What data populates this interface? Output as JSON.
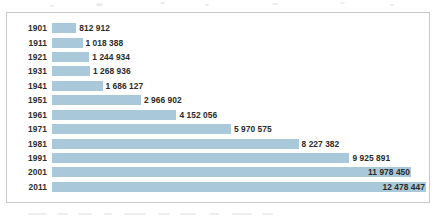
{
  "chart_data": {
    "type": "bar",
    "orientation": "horizontal",
    "title": "",
    "subtitle": "",
    "xlabel": "",
    "ylabel": "",
    "categories": [
      "1901",
      "1911",
      "1921",
      "1931",
      "1941",
      "1951",
      "1961",
      "1971",
      "1981",
      "1991",
      "2001",
      "2011"
    ],
    "values": [
      812912,
      1018388,
      1244934,
      1268936,
      1686127,
      2966902,
      4152056,
      5970575,
      8227382,
      9925891,
      11978450,
      12478447
    ],
    "value_labels": [
      "812 912",
      "1 018 388",
      "1 244 934",
      "1 268 936",
      "1 686 127",
      "2 966 902",
      "4 152 056",
      "5 970 575",
      "8 227 382",
      "9 925 891",
      "11 978 450",
      "12 478 447"
    ],
    "xlim": [
      0,
      12478447
    ],
    "grid": false,
    "legend": null,
    "legend_position": "none",
    "series": [
      {
        "name": "",
        "values": [
          812912,
          1018388,
          1244934,
          1268936,
          1686127,
          2966902,
          4152056,
          5970575,
          8227382,
          9925891,
          11978450,
          12478447
        ]
      }
    ],
    "bar_color": "#a9c8da",
    "label_color": "#2b2b2b",
    "frame_color": "#c9c9c9",
    "background_color": "#ffffff",
    "number_format": "space-separated thousands"
  },
  "rows": [
    {
      "year": "1901",
      "value": 812912,
      "label": "812 912"
    },
    {
      "year": "1911",
      "value": 1018388,
      "label": "1 018 388"
    },
    {
      "year": "1921",
      "value": 1244934,
      "label": "1 244 934"
    },
    {
      "year": "1931",
      "value": 1268936,
      "label": "1 268 936"
    },
    {
      "year": "1941",
      "value": 1686127,
      "label": "1 686 127"
    },
    {
      "year": "1951",
      "value": 2966902,
      "label": "2 966 902"
    },
    {
      "year": "1961",
      "value": 4152056,
      "label": "4 152 056"
    },
    {
      "year": "1971",
      "value": 5970575,
      "label": "5 970 575"
    },
    {
      "year": "1981",
      "value": 8227382,
      "label": "8 227 382"
    },
    {
      "year": "1991",
      "value": 9925891,
      "label": "9 925 891"
    },
    {
      "year": "2001",
      "value": 11978450,
      "label": "11 978 450"
    },
    {
      "year": "2011",
      "value": 12478447,
      "label": "12 478 447"
    }
  ],
  "layout": {
    "bar_origin_px": 45,
    "max_bar_px": 374,
    "row_height_px": 14.42,
    "first_row_top_px": 8
  }
}
